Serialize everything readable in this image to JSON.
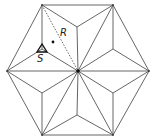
{
  "labels": {
    "R": "R",
    "S": "S"
  },
  "colors": {
    "line": "#555555",
    "dot": "#111111"
  }
}
